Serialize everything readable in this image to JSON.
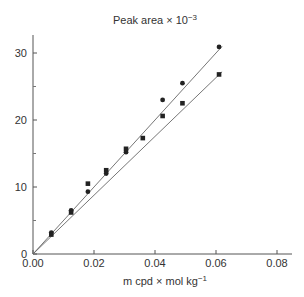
{
  "chart_data": {
    "type": "scatter",
    "title": "Peak area × 10",
    "title_exponent": "−3",
    "xlabel": "m cpd × mol kg",
    "xlabel_exponent": "−1",
    "ylabel": "Peak area × 10^-3",
    "xlim": [
      0,
      0.085
    ],
    "ylim": [
      0,
      32.5
    ],
    "x_ticks": [
      "0.00",
      "0.02",
      "0.04",
      "0.06",
      "0.08"
    ],
    "x_tick_values": [
      0,
      0.02,
      0.04,
      0.06,
      0.08
    ],
    "y_ticks": [
      "0",
      "10",
      "20",
      "30"
    ],
    "y_tick_values": [
      0,
      10,
      20,
      30
    ],
    "y_minor_ticks": [
      5,
      15,
      25
    ],
    "grid": false,
    "legend": null,
    "series": [
      {
        "name": "circles",
        "marker": "circle",
        "x": [
          0.006,
          0.0125,
          0.018,
          0.024,
          0.0305,
          0.0425,
          0.049,
          0.061
        ],
        "y": [
          3.2,
          6.5,
          9.3,
          12.0,
          15.2,
          23.0,
          25.5,
          30.9
        ],
        "fit_line": {
          "x": [
            0,
            0.062
          ],
          "y": [
            0,
            31.0
          ]
        }
      },
      {
        "name": "squares",
        "marker": "square",
        "x": [
          0.006,
          0.0125,
          0.018,
          0.024,
          0.0305,
          0.036,
          0.0425,
          0.049,
          0.061
        ],
        "y": [
          2.9,
          6.2,
          10.5,
          12.5,
          15.7,
          17.3,
          20.6,
          22.5,
          26.8
        ],
        "fit_line": {
          "x": [
            0,
            0.062
          ],
          "y": [
            0,
            27.2
          ]
        }
      }
    ]
  }
}
